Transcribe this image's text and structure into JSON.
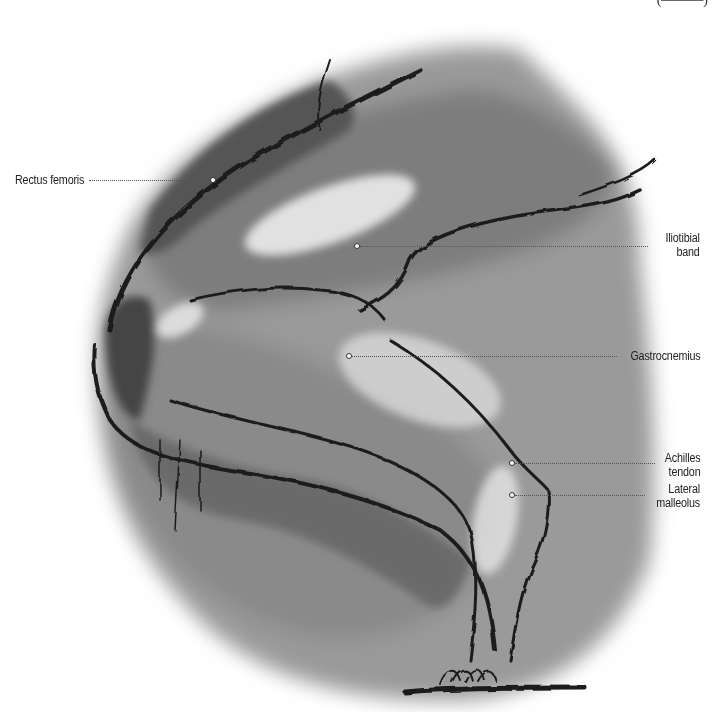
{
  "figure": {
    "top_caption_fragment": "(———)"
  },
  "labels": [
    {
      "id": "rectus-femoris",
      "text": "Rectus femoris",
      "side": "left",
      "dot": [
        213,
        180
      ]
    },
    {
      "id": "iliotibial-band",
      "line1": "Iliotibial",
      "line2": "band",
      "side": "right",
      "dot": [
        357,
        246
      ]
    },
    {
      "id": "gastrocnemius",
      "text": "Gastrocnemius",
      "side": "right",
      "dot": [
        349,
        356
      ]
    },
    {
      "id": "achilles-tendon",
      "line1": "Achilles",
      "line2": "tendon",
      "side": "right",
      "dot": [
        512,
        463
      ]
    },
    {
      "id": "lateral-malleolus",
      "line1": "Lateral",
      "line2": "malleolus",
      "side": "right",
      "dot": [
        512,
        495
      ]
    }
  ],
  "colors": {
    "paper": "#ffffff",
    "charcoal_dark": "#1e1e1e",
    "charcoal_mid": "#6e6e6e",
    "charcoal_light": "#b8b8b8",
    "label_text": "#222222"
  }
}
